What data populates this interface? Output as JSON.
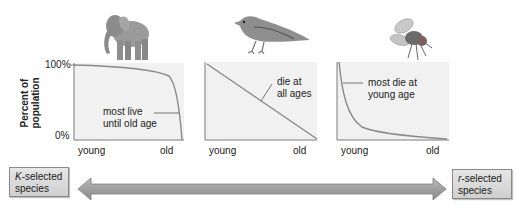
{
  "figure": {
    "y_axis_label": "Percent of population",
    "y_ticks": {
      "top": "100%",
      "bottom": "0%"
    },
    "panels": [
      {
        "id": "type-i",
        "organism": "elephant",
        "x_start_label": "young",
        "x_end_label": "old",
        "annotation": "most live until old age",
        "annotation_line1": "most live",
        "annotation_line2": "until old age"
      },
      {
        "id": "type-ii",
        "organism": "bird",
        "x_start_label": "young",
        "x_end_label": "old",
        "annotation": "die at all ages",
        "annotation_line1": "die at",
        "annotation_line2": "all ages"
      },
      {
        "id": "type-iii",
        "organism": "fly",
        "x_start_label": "young",
        "x_end_label": "old",
        "annotation": "most die at young age",
        "annotation_line1": "most die at",
        "annotation_line2": "young age"
      }
    ],
    "spectrum": {
      "left": {
        "prefix": "K",
        "suffix": "-selected",
        "line2": "species"
      },
      "right": {
        "prefix": "r",
        "suffix": "-selected",
        "line2": "species"
      }
    }
  },
  "colors": {
    "plot_bg": "#f1f1f1",
    "curve": "#8a8a8a",
    "axis": "#7a7a7a",
    "arrow_fill": "#a3a3a3",
    "box_fill": "#d8d8d8"
  }
}
